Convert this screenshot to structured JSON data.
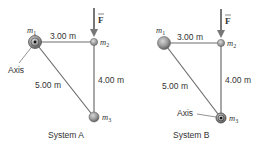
{
  "diagram": {
    "colors": {
      "rod": "#6e6e6e",
      "mass_fill": "#9a9a9a",
      "mass_dark": "#555555",
      "text": "#333333",
      "background": "#ffffff"
    },
    "systems": [
      {
        "caption": "System A",
        "masses": {
          "m1": "m",
          "m1_sub": "1",
          "m2": "m",
          "m2_sub": "2",
          "m3": "m",
          "m3_sub": "3"
        },
        "lengths": {
          "top": "3.00 m",
          "vertical": "4.00 m",
          "diagonal": "5.00 m"
        },
        "axis_label": "Axis",
        "axis_at": "m1",
        "force_label": "F"
      },
      {
        "caption": "System B",
        "masses": {
          "m1": "m",
          "m1_sub": "1",
          "m2": "m",
          "m2_sub": "2",
          "m3": "m",
          "m3_sub": "3"
        },
        "lengths": {
          "top": "3.00 m",
          "vertical": "4.00 m",
          "diagonal": "5.00 m"
        },
        "axis_label": "Axis",
        "axis_at": "m3",
        "force_label": "F"
      }
    ]
  }
}
